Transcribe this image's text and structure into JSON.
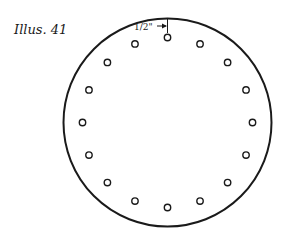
{
  "caption": "Illus. 41",
  "dimension_label": "1/2\"",
  "plate": {
    "shape": "circle",
    "center": [
      167.5,
      122.5
    ],
    "radius": 104,
    "stroke": "#1a1a1a"
  },
  "holes": {
    "count": 16,
    "bolt_circle_radius": 85,
    "hole_radius": 3.2,
    "start_angle_deg": -90
  },
  "dimension": {
    "description": "distance from plate edge to hole center",
    "value": "1/2\""
  }
}
